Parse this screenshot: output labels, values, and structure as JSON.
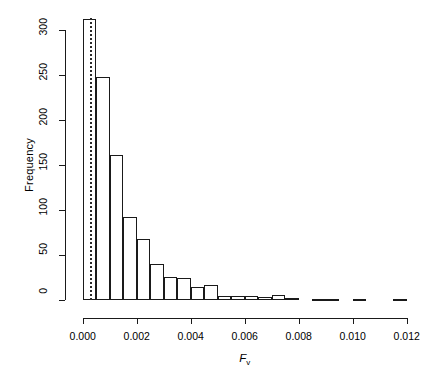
{
  "chart_data": {
    "type": "bar",
    "title": "",
    "subtitle": "",
    "xlabel": "F_v",
    "xlabel_base": "F",
    "xlabel_sub": "v",
    "ylabel": "Frequency",
    "xlim": [
      0.0,
      0.0122
    ],
    "ylim": [
      0,
      315
    ],
    "xticks": [
      0.0,
      0.002,
      0.004,
      0.006,
      0.008,
      0.01,
      0.012
    ],
    "xtick_labels": [
      "0.000",
      "0.002",
      "0.004",
      "0.006",
      "0.008",
      "0.010",
      "0.012"
    ],
    "yticks": [
      0,
      50,
      100,
      150,
      200,
      250,
      300
    ],
    "ytick_labels": [
      "0",
      "50",
      "100",
      "150",
      "200",
      "250",
      "300"
    ],
    "grid": false,
    "legend": null,
    "bin_width": 0.0005,
    "bin_edges": [
      0.0,
      0.0005,
      0.001,
      0.0015,
      0.002,
      0.0025,
      0.003,
      0.0035,
      0.004,
      0.0045,
      0.005,
      0.0055,
      0.006,
      0.0065,
      0.007,
      0.0075,
      0.008,
      0.0085,
      0.009,
      0.0095,
      0.01,
      0.0105,
      0.011,
      0.0115,
      0.012
    ],
    "categories": [
      "0.0000-0.0005",
      "0.0005-0.0010",
      "0.0010-0.0015",
      "0.0015-0.0020",
      "0.0020-0.0025",
      "0.0025-0.0030",
      "0.0030-0.0035",
      "0.0035-0.0040",
      "0.0040-0.0045",
      "0.0045-0.0050",
      "0.0050-0.0055",
      "0.0055-0.0060",
      "0.0060-0.0065",
      "0.0065-0.0070",
      "0.0070-0.0075",
      "0.0075-0.0080",
      "0.0080-0.0085",
      "0.0085-0.0090",
      "0.0090-0.0095",
      "0.0095-0.0100",
      "0.0100-0.0105",
      "0.0105-0.0110",
      "0.0110-0.0115",
      "0.0115-0.0120"
    ],
    "values": [
      312,
      248,
      161,
      92,
      68,
      40,
      26,
      24,
      14,
      17,
      4,
      5,
      5,
      3,
      6,
      2,
      0,
      1,
      1,
      0,
      1,
      0,
      0,
      1
    ],
    "annotations": [
      {
        "type": "vline",
        "name": "reference-line",
        "x": 0.00027,
        "style": "dotted",
        "color": "#2a2a2a"
      }
    ],
    "colors": {
      "axis": "#1a1a1a",
      "bar_edge": "#1a1a1a",
      "bar_fill": "transparent",
      "background": "#ffffff",
      "vline": "#2a2a2a"
    }
  }
}
